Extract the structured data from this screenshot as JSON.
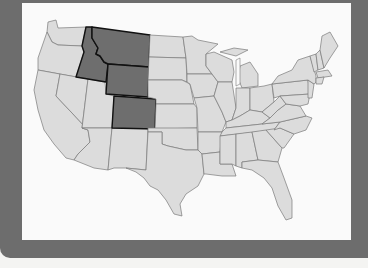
{
  "map": {
    "title": "Contiguous United States",
    "highlighted_states": [
      "Idaho",
      "Montana",
      "Wyoming",
      "Colorado"
    ],
    "colors": {
      "highlight_fill": "#6e6e6e",
      "state_fill": "#dcdcdc",
      "frame": "#6d6d6d",
      "background": "#fafafa"
    }
  }
}
